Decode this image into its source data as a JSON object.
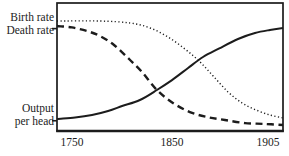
{
  "figure": {
    "background": "#ffffff",
    "ink_color": "#1c1c1c"
  },
  "labels": {
    "birth_rate": "Birth rate",
    "death_rate": "Death rate",
    "output_line1": "Output",
    "output_line2": "per head"
  },
  "chart_data": {
    "type": "line",
    "title": "",
    "xlabel": "",
    "ylabel": "",
    "grid": false,
    "legend_position": "curve labels at left margin",
    "axes_note": "schematic chart: framed box, qualitative unlabeled y-axis, non-linear year axis",
    "x_axis": {
      "ticks": [
        {
          "label": "1750",
          "frac": 0.066
        },
        {
          "label": "1850",
          "frac": 0.509
        },
        {
          "label": "1905",
          "frac": 0.934
        }
      ]
    },
    "left_axis_marks_frac": [
      0.2,
      0.92
    ],
    "series": [
      {
        "name": "Birth rate",
        "style": "dotted",
        "points_frac": [
          [
            0.0,
            0.141
          ],
          [
            0.19,
            0.141
          ],
          [
            0.323,
            0.156
          ],
          [
            0.412,
            0.195
          ],
          [
            0.491,
            0.266
          ],
          [
            0.566,
            0.359
          ],
          [
            0.633,
            0.461
          ],
          [
            0.695,
            0.578
          ],
          [
            0.757,
            0.695
          ],
          [
            0.819,
            0.781
          ],
          [
            0.881,
            0.836
          ],
          [
            0.942,
            0.875
          ],
          [
            1.0,
            0.898
          ]
        ]
      },
      {
        "name": "Death rate",
        "style": "dashed",
        "points_frac": [
          [
            0.0,
            0.18
          ],
          [
            0.066,
            0.191
          ],
          [
            0.133,
            0.219
          ],
          [
            0.19,
            0.258
          ],
          [
            0.252,
            0.328
          ],
          [
            0.314,
            0.43
          ],
          [
            0.376,
            0.539
          ],
          [
            0.442,
            0.68
          ],
          [
            0.513,
            0.781
          ],
          [
            0.588,
            0.852
          ],
          [
            0.664,
            0.891
          ],
          [
            0.743,
            0.914
          ],
          [
            0.832,
            0.938
          ],
          [
            0.92,
            0.945
          ],
          [
            1.0,
            0.953
          ]
        ]
      },
      {
        "name": "Output per head",
        "style": "solid",
        "points_frac": [
          [
            0.0,
            0.906
          ],
          [
            0.08,
            0.895
          ],
          [
            0.155,
            0.875
          ],
          [
            0.226,
            0.844
          ],
          [
            0.288,
            0.805
          ],
          [
            0.367,
            0.758
          ],
          [
            0.442,
            0.68
          ],
          [
            0.509,
            0.602
          ],
          [
            0.58,
            0.508
          ],
          [
            0.646,
            0.422
          ],
          [
            0.721,
            0.352
          ],
          [
            0.801,
            0.281
          ],
          [
            0.876,
            0.234
          ],
          [
            0.942,
            0.211
          ],
          [
            1.0,
            0.195
          ]
        ]
      }
    ]
  }
}
